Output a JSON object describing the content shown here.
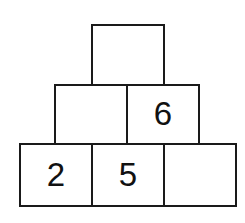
{
  "figure": {
    "type": "number-pyramid",
    "background_color": "#ffffff",
    "line_color": "#1a1a1a",
    "text_color": "#111111",
    "rows": [
      {
        "row_name": "top-row",
        "level": 3,
        "cells": [
          {
            "cell_name": "top-cell-1",
            "value": "",
            "filled": false
          }
        ]
      },
      {
        "row_name": "middle-row",
        "level": 2,
        "cells": [
          {
            "cell_name": "middle-cell-1",
            "value": "",
            "filled": false
          },
          {
            "cell_name": "middle-cell-2",
            "value": "6",
            "filled": true
          }
        ]
      },
      {
        "row_name": "bottom-row",
        "level": 1,
        "cells": [
          {
            "cell_name": "bottom-cell-1",
            "value": "2",
            "filled": true
          },
          {
            "cell_name": "bottom-cell-2",
            "value": "5",
            "filled": true
          },
          {
            "cell_name": "bottom-cell-3",
            "value": "",
            "filled": false
          }
        ]
      }
    ]
  }
}
